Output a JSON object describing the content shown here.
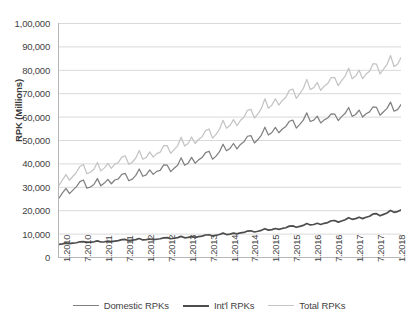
{
  "chart_data": {
    "type": "line",
    "title": "",
    "xlabel": "",
    "ylabel": "RPK (Millions)",
    "ylim": [
      0,
      100000
    ],
    "ytick_labels": [
      "1,00,000",
      "90,000",
      "80,000",
      "70,000",
      "60,000",
      "50,000",
      "40,000",
      "30,000",
      "20,000",
      "10,000",
      "0"
    ],
    "ytick_values": [
      100000,
      90000,
      80000,
      70000,
      60000,
      50000,
      40000,
      30000,
      20000,
      10000,
      0
    ],
    "xtick_labels": [
      "1.2010",
      "7.2010",
      "1.2011",
      "7.2011",
      "1.2012",
      "7.2012",
      "1.2013",
      "7.2013",
      "1.2014",
      "7.2014",
      "1.2015",
      "7.2015",
      "1.2016",
      "7.2016",
      "1.2017",
      "7.2017",
      "1.2018"
    ],
    "xtick_indices": [
      0,
      6,
      12,
      18,
      24,
      30,
      36,
      42,
      48,
      54,
      60,
      66,
      72,
      78,
      84,
      90,
      96
    ],
    "grid": true,
    "legend_position": "bottom",
    "colors": {
      "domestic": "#808080",
      "intl": "#4d4d4d",
      "total": "#c4c4c4",
      "gridline": "#d9d9d9",
      "axis": "#b6b6b6"
    },
    "series": [
      {
        "name": "Domestic RPKs",
        "color": "#808080",
        "values": [
          25200,
          27400,
          29300,
          27100,
          28600,
          30100,
          32200,
          32900,
          29400,
          29900,
          31000,
          33500,
          30400,
          31600,
          33200,
          31300,
          32900,
          33400,
          35300,
          35700,
          32600,
          33300,
          34900,
          37600,
          34500,
          35100,
          37200,
          35300,
          36600,
          37000,
          39400,
          39300,
          36500,
          37900,
          39200,
          42400,
          39200,
          40100,
          42600,
          40100,
          41500,
          42500,
          44600,
          45200,
          41800,
          43100,
          45000,
          48200,
          45400,
          46400,
          48500,
          46200,
          48100,
          49200,
          51600,
          51900,
          48700,
          50200,
          52100,
          55500,
          52100,
          53200,
          55400,
          53100,
          54700,
          55800,
          58000,
          58500,
          55100,
          56700,
          58500,
          61600,
          57900,
          58500,
          60200,
          57300,
          58600,
          59400,
          61200,
          61100,
          58300,
          60000,
          61400,
          63900,
          60100,
          60900,
          62800,
          59800,
          61200,
          62000,
          64200,
          63900,
          60600,
          62100,
          63500,
          66200,
          62300,
          63000,
          65100
        ]
      },
      {
        "name": "Int'l RPKs",
        "color": "#4d4d4d",
        "values": [
          5400,
          5600,
          5900,
          5700,
          5900,
          6100,
          6500,
          6600,
          6200,
          6300,
          6500,
          6900,
          6400,
          6500,
          6800,
          6600,
          6800,
          7000,
          7400,
          7500,
          7000,
          7200,
          7400,
          7900,
          7300,
          7400,
          7700,
          7400,
          7600,
          7800,
          8200,
          8300,
          7800,
          8000,
          8300,
          8800,
          8200,
          8400,
          8700,
          8400,
          8700,
          8900,
          9400,
          9500,
          9000,
          9300,
          9600,
          10200,
          9600,
          9800,
          10200,
          9900,
          10300,
          10500,
          11100,
          11200,
          10700,
          11000,
          11400,
          12100,
          11500,
          11700,
          12200,
          11800,
          12200,
          12500,
          13200,
          13300,
          12700,
          13100,
          13500,
          14300,
          13700,
          13900,
          14400,
          13900,
          14400,
          14700,
          15500,
          15600,
          14900,
          15400,
          15900,
          16800,
          16100,
          16400,
          17000,
          16400,
          17000,
          17400,
          18400,
          18500,
          17600,
          18200,
          18800,
          19900,
          19100,
          19400,
          20100
        ]
      },
      {
        "name": "Total RPKs",
        "color": "#c4c4c4",
        "values": [
          30600,
          33000,
          35200,
          32800,
          34500,
          36200,
          38700,
          39500,
          35600,
          36200,
          37500,
          40400,
          36800,
          38100,
          40000,
          37900,
          39700,
          40400,
          42700,
          43200,
          39600,
          40500,
          42300,
          45500,
          41800,
          42500,
          44900,
          42700,
          44200,
          44800,
          47600,
          47600,
          44300,
          45900,
          47500,
          51200,
          47400,
          48500,
          51300,
          48500,
          50200,
          51400,
          54000,
          54700,
          50800,
          52400,
          54600,
          58400,
          55000,
          56200,
          58700,
          56100,
          58400,
          59700,
          62700,
          63100,
          59400,
          61200,
          63500,
          67600,
          63600,
          64900,
          67600,
          64900,
          66900,
          68300,
          71200,
          71800,
          67800,
          69800,
          72000,
          75900,
          71600,
          72400,
          74600,
          71200,
          73000,
          74100,
          76700,
          76700,
          73200,
          75400,
          77300,
          80700,
          76200,
          77300,
          79800,
          76200,
          78200,
          79400,
          82600,
          82400,
          78200,
          80300,
          82300,
          86100,
          81400,
          82400,
          85200
        ]
      }
    ]
  },
  "legend": {
    "items": [
      {
        "label": "Domestic RPKs",
        "color": "#808080",
        "width": 1.6
      },
      {
        "label": "Int'l RPKs",
        "color": "#4d4d4d",
        "width": 2.2
      },
      {
        "label": "Total RPKs",
        "color": "#c4c4c4",
        "width": 1.6
      }
    ]
  }
}
